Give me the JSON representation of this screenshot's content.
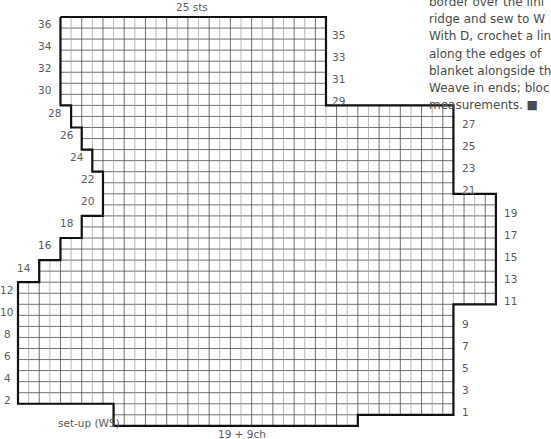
{
  "diagram": {
    "type": "knitting-chart",
    "top_label": "25 sts",
    "bottom_label": "19 + 9ch",
    "setup_label": "set-up (WS)",
    "grid": {
      "origin_x": 18,
      "origin_y": 17,
      "cell_w": 10.62,
      "cell_h": 11.05,
      "columns": 45,
      "rows": 37,
      "row_spans": [
        [
          4,
          29
        ],
        [
          4,
          29
        ],
        [
          4,
          29
        ],
        [
          4,
          29
        ],
        [
          4,
          29
        ],
        [
          4,
          29
        ],
        [
          4,
          29
        ],
        [
          4,
          29
        ],
        [
          5,
          41
        ],
        [
          5,
          41
        ],
        [
          6,
          41
        ],
        [
          6,
          41
        ],
        [
          7,
          41
        ],
        [
          7,
          41
        ],
        [
          8,
          41
        ],
        [
          8,
          41
        ],
        [
          8,
          45
        ],
        [
          8,
          45
        ],
        [
          6,
          45
        ],
        [
          6,
          45
        ],
        [
          4,
          45
        ],
        [
          4,
          45
        ],
        [
          2,
          45
        ],
        [
          2,
          45
        ],
        [
          0,
          45
        ],
        [
          0,
          45
        ],
        [
          0,
          41
        ],
        [
          0,
          41
        ],
        [
          0,
          41
        ],
        [
          0,
          41
        ],
        [
          0,
          41
        ],
        [
          0,
          41
        ],
        [
          0,
          41
        ],
        [
          0,
          41
        ],
        [
          0,
          41
        ],
        [
          9,
          41
        ],
        [
          9,
          32
        ]
      ],
      "outline": [
        [
          4,
          0
        ],
        [
          29,
          0
        ],
        [
          29,
          8
        ],
        [
          41,
          8
        ],
        [
          41,
          16
        ],
        [
          45,
          16
        ],
        [
          45,
          26
        ],
        [
          41,
          26
        ],
        [
          41,
          36
        ],
        [
          32,
          36
        ],
        [
          32,
          37
        ],
        [
          9,
          37
        ],
        [
          9,
          35
        ],
        [
          0,
          35
        ],
        [
          0,
          24
        ],
        [
          2,
          24
        ],
        [
          2,
          22
        ],
        [
          4,
          22
        ],
        [
          4,
          20
        ],
        [
          6,
          20
        ],
        [
          6,
          18
        ],
        [
          8,
          18
        ],
        [
          8,
          14
        ],
        [
          7,
          14
        ],
        [
          7,
          12
        ],
        [
          6,
          12
        ],
        [
          6,
          10
        ],
        [
          5,
          10
        ],
        [
          5,
          8
        ],
        [
          4,
          8
        ],
        [
          4,
          0
        ]
      ],
      "line_color": "#333333",
      "light_line_color": "#9a9a9a",
      "outline_color": "#111111"
    },
    "left_row_labels": [
      {
        "text": "36",
        "x": 38,
        "y": 19
      },
      {
        "text": "34",
        "x": 38,
        "y": 41
      },
      {
        "text": "32",
        "x": 38,
        "y": 63
      },
      {
        "text": "30",
        "x": 38,
        "y": 85
      },
      {
        "text": "28",
        "x": 48,
        "y": 108
      },
      {
        "text": "26",
        "x": 60,
        "y": 130
      },
      {
        "text": "24",
        "x": 70,
        "y": 152
      },
      {
        "text": "22",
        "x": 81,
        "y": 174
      },
      {
        "text": "20",
        "x": 81,
        "y": 196
      },
      {
        "text": "18",
        "x": 60,
        "y": 218
      },
      {
        "text": "16",
        "x": 38,
        "y": 240
      },
      {
        "text": "14",
        "x": 17,
        "y": 263
      },
      {
        "text": "12",
        "x": 0,
        "y": 285
      },
      {
        "text": "10",
        "x": 0,
        "y": 307
      },
      {
        "text": "8",
        "x": 4,
        "y": 329
      },
      {
        "text": "6",
        "x": 4,
        "y": 351
      },
      {
        "text": "4",
        "x": 4,
        "y": 373
      },
      {
        "text": "2",
        "x": 4,
        "y": 395
      }
    ],
    "right_row_labels": [
      {
        "text": "35",
        "x": 332,
        "y": 30
      },
      {
        "text": "33",
        "x": 332,
        "y": 52
      },
      {
        "text": "31",
        "x": 332,
        "y": 74
      },
      {
        "text": "29",
        "x": 332,
        "y": 96
      },
      {
        "text": "27",
        "x": 462,
        "y": 119
      },
      {
        "text": "25",
        "x": 462,
        "y": 141
      },
      {
        "text": "23",
        "x": 462,
        "y": 163
      },
      {
        "text": "21",
        "x": 462,
        "y": 185
      },
      {
        "text": "19",
        "x": 504,
        "y": 208
      },
      {
        "text": "17",
        "x": 504,
        "y": 230
      },
      {
        "text": "15",
        "x": 504,
        "y": 252
      },
      {
        "text": "13",
        "x": 504,
        "y": 274
      },
      {
        "text": "11",
        "x": 504,
        "y": 296
      },
      {
        "text": "9",
        "x": 462,
        "y": 319
      },
      {
        "text": "7",
        "x": 462,
        "y": 341
      },
      {
        "text": "5",
        "x": 462,
        "y": 363
      },
      {
        "text": "3",
        "x": 462,
        "y": 385
      },
      {
        "text": "1",
        "x": 462,
        "y": 407
      }
    ]
  },
  "side_text": {
    "lines": [
      "border over the lini",
      "ridge and sew to W",
      "With D, crochet a lin",
      "along the edges of",
      "blanket alongside th",
      "Weave in ends; bloc",
      "measurements. ■"
    ]
  }
}
